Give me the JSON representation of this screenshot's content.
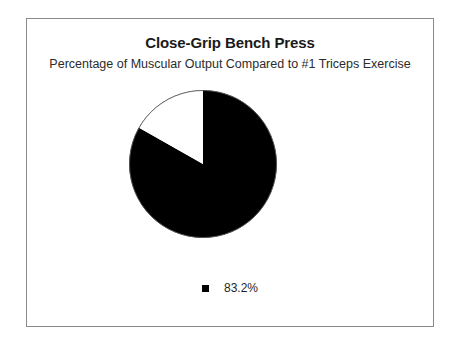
{
  "chart": {
    "title": "Close-Grip Bench Press",
    "subtitle": "Percentage of Muscular Output Compared to #1 Triceps Exercise",
    "legend": [
      {
        "label": "83.2%",
        "color": "#000000",
        "swatch_name": "legend-swatch-black"
      }
    ]
  },
  "chart_data": {
    "type": "pie",
    "title": "Close-Grip Bench Press",
    "subtitle": "Percentage of Muscular Output Compared to #1 Triceps Exercise",
    "categories": [
      "83.2%",
      "remainder"
    ],
    "values": [
      83.2,
      16.8
    ],
    "labels": [
      "83.2%",
      ""
    ],
    "colors": [
      "#000000",
      "#ffffff"
    ],
    "start_angle_deg": 0,
    "direction": "clockwise",
    "legend_position": "bottom",
    "grid": false,
    "xlabel": "",
    "ylabel": "",
    "annotations": []
  }
}
